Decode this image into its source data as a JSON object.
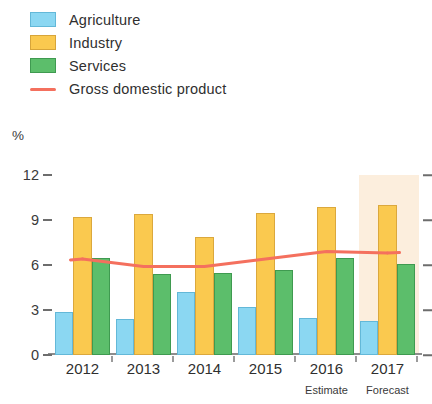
{
  "legend": {
    "items": [
      {
        "label": "Agriculture",
        "color": "#8BD7F2",
        "marker": "swatch"
      },
      {
        "label": "Industry",
        "color": "#FAC94F",
        "marker": "swatch"
      },
      {
        "label": "Services",
        "color": "#5CBE6B",
        "marker": "swatch"
      },
      {
        "label": "Gross domestic product",
        "color": "#F4705E",
        "marker": "line"
      }
    ]
  },
  "axis": {
    "unit_label": "%",
    "y_ticks": [
      "0",
      "3",
      "6",
      "9",
      "12"
    ]
  },
  "annotations": {
    "estimate": "Estimate",
    "forecast": "Forecast"
  },
  "chart_data": {
    "type": "bar",
    "title": "",
    "xlabel": "",
    "ylabel": "%",
    "ylim": [
      0,
      12
    ],
    "yticks": [
      0,
      3,
      6,
      9,
      12
    ],
    "grid": false,
    "legend_position": "top-left",
    "categories": [
      "2012",
      "2013",
      "2014",
      "2015",
      "2016",
      "2017"
    ],
    "series": [
      {
        "name": "Agriculture",
        "type": "bar",
        "color": "#8BD7F2",
        "values": [
          2.9,
          2.4,
          4.2,
          3.2,
          2.5,
          2.3
        ]
      },
      {
        "name": "Industry",
        "type": "bar",
        "color": "#FAC94F",
        "values": [
          9.2,
          9.4,
          7.9,
          9.5,
          9.9,
          10.0
        ]
      },
      {
        "name": "Services",
        "type": "bar",
        "color": "#5CBE6B",
        "values": [
          6.5,
          5.4,
          5.5,
          5.7,
          6.5,
          6.1
        ]
      },
      {
        "name": "Gross domestic product",
        "type": "line",
        "color": "#F4705E",
        "values": [
          6.4,
          5.9,
          5.9,
          6.4,
          6.9,
          6.8
        ]
      }
    ],
    "shaded_region": {
      "from": "2017",
      "to": "2017",
      "color": "#FAE3C8",
      "label": "Forecast"
    },
    "category_notes": {
      "2016": "Estimate",
      "2017": "Forecast"
    }
  }
}
